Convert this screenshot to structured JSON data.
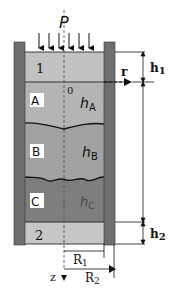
{
  "diagram": {
    "force_label": "P",
    "piston_top_label": "1",
    "piston_bottom_label": "2",
    "origin_label": "0",
    "radial_axis_label": "r",
    "axial_axis_label": "z",
    "layers": [
      {
        "id": "A",
        "label": "A",
        "height_label_base": "h",
        "height_label_sub": "A",
        "color": "#b4b4b4"
      },
      {
        "id": "B",
        "label": "B",
        "height_label_base": "h",
        "height_label_sub": "B",
        "color": "#a2a2a2"
      },
      {
        "id": "C",
        "label": "C",
        "height_label_base": "h",
        "height_label_sub": "C",
        "color": "#7e7e7e"
      }
    ],
    "dimensions": {
      "h1": {
        "base": "h",
        "sub": "1"
      },
      "h2": {
        "base": "h",
        "sub": "2"
      },
      "R1": {
        "base": "R",
        "sub": "1"
      },
      "R2": {
        "base": "R",
        "sub": "2"
      }
    },
    "colors": {
      "wall": "#6e6e6e",
      "piston_top": "#c2c2c2",
      "piston_bottom": "#c6c6c6",
      "line": "#111111"
    }
  }
}
